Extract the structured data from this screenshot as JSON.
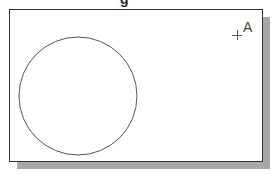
{
  "title_fragment": "g",
  "drawing": {
    "circle": {
      "cx": 78,
      "cy": 96,
      "r": 59,
      "stroke": "#555555"
    },
    "point": {
      "x": 237,
      "y": 35,
      "marker": "+"
    },
    "point_label": "A"
  },
  "colors": {
    "frame_border": "#333333",
    "shadow": "#a8a8a8",
    "background": "#ffffff"
  }
}
